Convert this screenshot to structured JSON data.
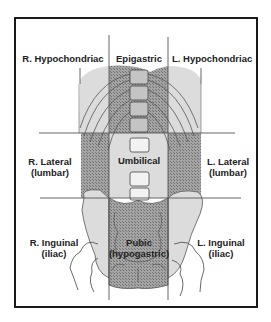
{
  "diagram": {
    "colors": {
      "frame": "#1a1a1a",
      "light_region": "#dcdcdc",
      "dark_region": "#9a9a9a",
      "hatch": "#6f6f6f",
      "outline": "#444444",
      "background": "#ffffff"
    },
    "regions": {
      "r_hypochondriac": {
        "line1": "R. Hypochondriac",
        "line2": ""
      },
      "epigastric": {
        "line1": "Epigastric",
        "line2": ""
      },
      "l_hypochondriac": {
        "line1": "L. Hypochondriac",
        "line2": ""
      },
      "r_lateral": {
        "line1": "R. Lateral",
        "line2": "(lumbar)"
      },
      "umbilical": {
        "line1": "Umbilical",
        "line2": ""
      },
      "l_lateral": {
        "line1": "L. Lateral",
        "line2": "(lumbar)"
      },
      "r_inguinal": {
        "line1": "R. Inguinal",
        "line2": "(iliac)"
      },
      "pubic": {
        "line1": "Pubic",
        "line2": "(hypogastric)"
      },
      "l_inguinal": {
        "line1": "L. Inguinal",
        "line2": "(iliac)"
      }
    },
    "grid": {
      "vertical_lines_x": [
        109,
        168
      ],
      "horizontal_lines_y": [
        133,
        198
      ]
    }
  }
}
